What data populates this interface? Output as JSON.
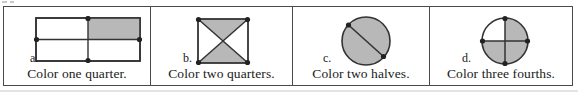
{
  "worksheet": {
    "colors": {
      "shade": "#b8b8b8",
      "line": "#333333",
      "border": "#4a4a4a",
      "text": "#1a1a1a",
      "background": "#ffffff"
    },
    "panels": [
      {
        "letter": "a.",
        "caption": "Color one quarter.",
        "shape": "rectangle-quarters",
        "shaded_parts": [
          "top-right"
        ],
        "total_parts": 4,
        "shaded_count": 1,
        "fraction": "1/4"
      },
      {
        "letter": "b.",
        "caption": "Color two quarters.",
        "shape": "square-diagonals",
        "shaded_parts": [
          "top-triangle",
          "bottom-triangle"
        ],
        "total_parts": 4,
        "shaded_count": 2,
        "fraction": "2/4"
      },
      {
        "letter": "c.",
        "caption": "Color two halves.",
        "shape": "circle-chord",
        "shaded_parts": [
          "upper-half",
          "lower-half"
        ],
        "total_parts": 2,
        "shaded_count": 2,
        "fraction": "2/2"
      },
      {
        "letter": "d.",
        "caption": "Color three fourths.",
        "shape": "circle-quarters",
        "shaded_parts": [
          "top-right",
          "bottom-right",
          "bottom-left"
        ],
        "total_parts": 4,
        "shaded_count": 3,
        "fraction": "3/4"
      }
    ]
  }
}
